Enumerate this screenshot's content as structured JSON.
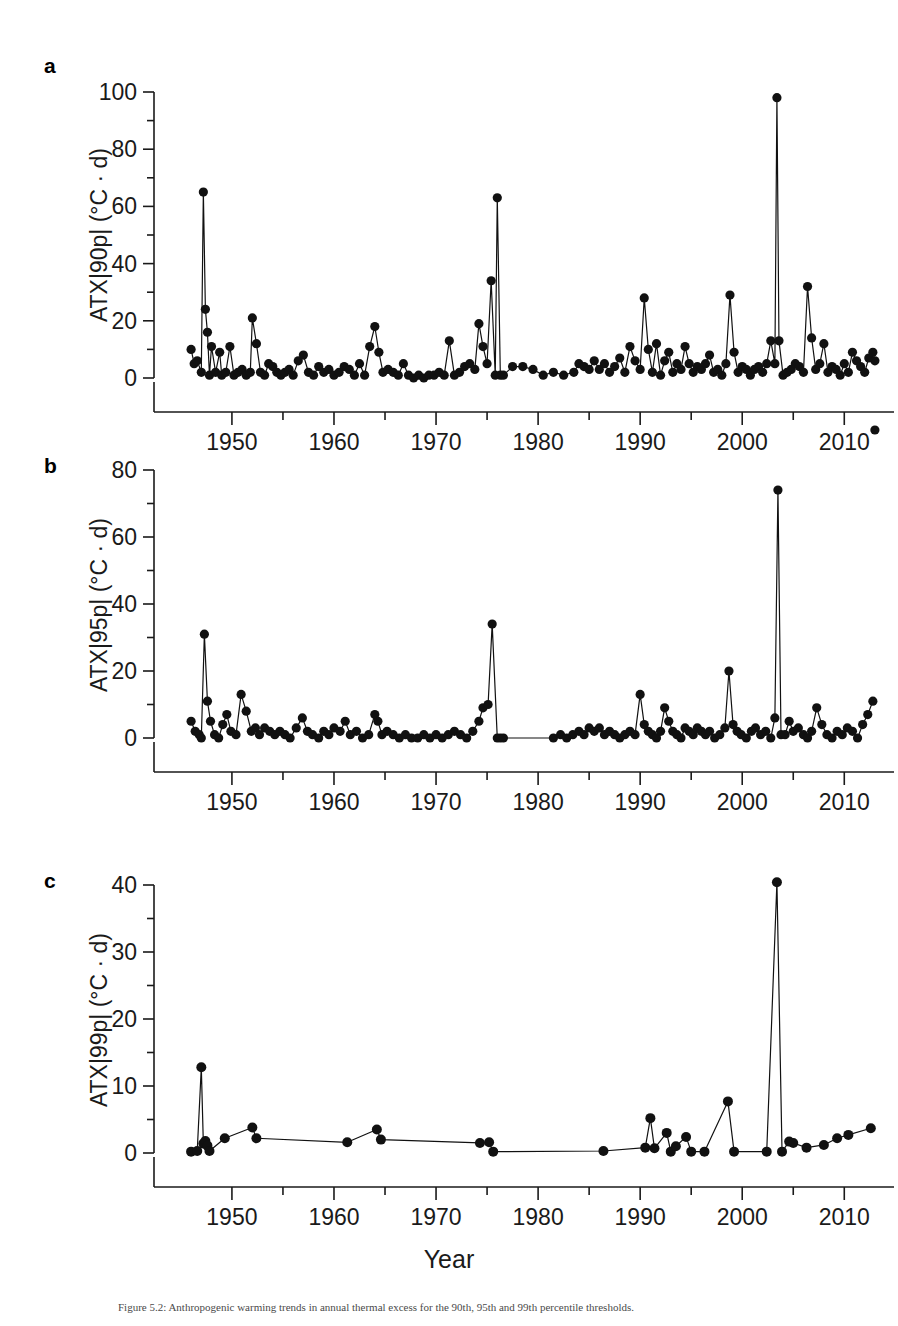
{
  "figure": {
    "panels": [
      {
        "letter": "a",
        "ylabel": "ATX|90p| (°C · d)",
        "xlabel": "",
        "id": "panel-a"
      },
      {
        "letter": "b",
        "ylabel": "ATX|95p| (°C · d)",
        "xlabel": "",
        "id": "panel-b"
      },
      {
        "letter": "c",
        "ylabel": "ATX|99p| (°C · d)",
        "xlabel": "Year",
        "id": "panel-c"
      }
    ],
    "caption": "Figure 5.2: Anthropogenic warming trends in annual thermal excess for the 90th, 95th and 99th percentile thresholds."
  },
  "chart_data": [
    {
      "type": "line",
      "panel": "a",
      "title": "",
      "xlabel": "",
      "ylabel": "ATX|90p| (°C · d)",
      "xlim": [
        1945.5,
        2013.5
      ],
      "ylim": [
        0,
        100
      ],
      "yticks": [
        0,
        20,
        40,
        60,
        80,
        100
      ],
      "ytick_minor_step": 10,
      "xticks": [
        1950,
        1960,
        1970,
        1980,
        1990,
        2000,
        2010
      ],
      "xtick_minor_step": 5,
      "grid": false,
      "legend": "none",
      "marker": "filled-circle",
      "x": [
        1946,
        1946.3,
        1946.6,
        1947,
        1947.2,
        1947.4,
        1947.6,
        1947.8,
        1948,
        1948.4,
        1948.8,
        1949,
        1949.4,
        1949.8,
        1950.2,
        1950.6,
        1951,
        1951.4,
        1951.8,
        1952,
        1952.4,
        1952.8,
        1953.2,
        1953.6,
        1954,
        1954.4,
        1954.8,
        1955.2,
        1955.6,
        1956,
        1956.5,
        1957,
        1957.5,
        1958,
        1958.5,
        1959,
        1959.5,
        1960,
        1960.5,
        1961,
        1961.5,
        1962,
        1962.5,
        1963,
        1963.5,
        1964,
        1964.4,
        1964.8,
        1965.3,
        1965.8,
        1966.3,
        1966.8,
        1967.3,
        1967.8,
        1968.3,
        1968.8,
        1969.3,
        1969.8,
        1970.3,
        1970.8,
        1971.3,
        1971.8,
        1972.3,
        1972.8,
        1973.3,
        1973.8,
        1974.2,
        1974.6,
        1975,
        1975.4,
        1975.8,
        1976,
        1976.3,
        1976.6,
        1977.5,
        1978.5,
        1979.5,
        1980.5,
        1981.5,
        1982.5,
        1983.5,
        1984,
        1984.5,
        1985,
        1985.5,
        1986,
        1986.5,
        1987,
        1987.5,
        1988,
        1988.5,
        1989,
        1989.5,
        1990,
        1990.4,
        1990.8,
        1991.2,
        1991.6,
        1992,
        1992.4,
        1992.8,
        1993.2,
        1993.6,
        1994,
        1994.4,
        1994.8,
        1995.2,
        1995.6,
        1996,
        1996.4,
        1996.8,
        1997.2,
        1997.6,
        1998,
        1998.4,
        1998.8,
        1999.2,
        1999.6,
        2000,
        2000.4,
        2000.8,
        2001.2,
        2001.6,
        2002,
        2002.4,
        2002.8,
        2003.2,
        2003.4,
        2003.6,
        2004,
        2004.4,
        2004.8,
        2005.2,
        2005.6,
        2006,
        2006.4,
        2006.8,
        2007.2,
        2007.6,
        2008,
        2008.4,
        2008.8,
        2009.2,
        2009.6,
        2010,
        2010.4,
        2010.8,
        2011.2,
        2011.6,
        2012,
        2012.4,
        2012.8,
        2013
      ],
      "y": [
        10,
        5,
        6,
        2,
        65,
        24,
        16,
        1,
        11,
        2,
        9,
        1,
        2,
        11,
        1,
        2,
        3,
        1,
        2,
        21,
        12,
        2,
        1,
        5,
        4,
        2,
        1,
        2,
        3,
        1,
        6,
        8,
        2,
        1,
        4,
        2,
        3,
        1,
        2,
        4,
        3,
        1,
        5,
        1,
        11,
        18,
        9,
        2,
        3,
        2,
        1,
        5,
        1,
        0,
        1,
        0,
        1,
        1,
        2,
        1,
        13,
        1,
        2,
        4,
        5,
        3,
        19,
        11,
        5,
        34,
        1,
        63,
        1,
        1,
        4,
        4,
        3,
        1,
        2,
        1,
        2,
        5,
        4,
        3,
        6,
        3,
        5,
        2,
        4,
        7,
        2,
        11,
        6,
        3,
        28,
        10,
        2,
        12,
        1,
        6,
        9,
        2,
        5,
        3,
        11,
        5,
        2,
        4,
        3,
        5,
        8,
        2,
        3,
        1,
        5,
        29,
        9,
        2,
        4,
        3,
        1,
        3,
        4,
        2,
        5,
        13,
        5,
        98,
        13,
        1,
        2,
        3,
        5,
        4,
        2,
        32,
        14,
        3,
        5,
        12,
        2,
        4,
        3,
        1,
        5,
        2,
        9,
        6,
        4,
        2,
        7,
        9,
        6,
        19
      ]
    },
    {
      "type": "line",
      "panel": "b",
      "title": "",
      "xlabel": "",
      "ylabel": "ATX|95p| (°C · d)",
      "xlim": [
        1945.5,
        2013.5
      ],
      "ylim": [
        0,
        80
      ],
      "yticks": [
        0,
        20,
        40,
        60,
        80
      ],
      "ytick_minor_step": 10,
      "xticks": [
        1950,
        1960,
        1970,
        1980,
        1990,
        2000,
        2010
      ],
      "xtick_minor_step": 5,
      "grid": false,
      "legend": "none",
      "marker": "filled-circle",
      "x": [
        1946,
        1946.4,
        1946.8,
        1947,
        1947.3,
        1947.6,
        1947.9,
        1948.3,
        1948.7,
        1949.1,
        1949.5,
        1949.9,
        1950.4,
        1950.9,
        1951.4,
        1951.9,
        1952.3,
        1952.7,
        1953.2,
        1953.7,
        1954.2,
        1954.7,
        1955.2,
        1955.7,
        1956.3,
        1956.9,
        1957.4,
        1957.9,
        1958.5,
        1959,
        1959.5,
        1960,
        1960.6,
        1961.1,
        1961.6,
        1962.2,
        1962.8,
        1963.4,
        1964,
        1964.3,
        1964.7,
        1965.2,
        1965.8,
        1966.4,
        1967,
        1967.6,
        1968.2,
        1968.8,
        1969.4,
        1970,
        1970.6,
        1971.2,
        1971.8,
        1972.4,
        1973,
        1973.6,
        1974.2,
        1974.6,
        1975.1,
        1975.5,
        1976,
        1976.3,
        1976.6,
        1981.5,
        1982.2,
        1982.8,
        1983.4,
        1984,
        1984.5,
        1985,
        1985.5,
        1986,
        1986.5,
        1987,
        1987.5,
        1988,
        1988.5,
        1989,
        1989.5,
        1990,
        1990.4,
        1990.8,
        1991.2,
        1991.6,
        1992,
        1992.4,
        1992.8,
        1993.2,
        1993.6,
        1994,
        1994.4,
        1994.8,
        1995.2,
        1995.6,
        1996,
        1996.4,
        1996.8,
        1997.3,
        1997.8,
        1998.3,
        1998.7,
        1999.1,
        1999.5,
        1999.9,
        2000.4,
        2000.9,
        2001.3,
        2001.8,
        2002.3,
        2002.8,
        2003.2,
        2003.5,
        2003.8,
        2004.2,
        2004.6,
        2005,
        2005.5,
        2006,
        2006.4,
        2006.8,
        2007.3,
        2007.8,
        2008.3,
        2008.8,
        2009.3,
        2009.8,
        2010.3,
        2010.8,
        2011.3,
        2011.8,
        2012.3,
        2012.8,
        2013
      ],
      "y": [
        5,
        2,
        1,
        0,
        31,
        11,
        5,
        1,
        0,
        4,
        7,
        2,
        1,
        13,
        8,
        2,
        3,
        1,
        3,
        2,
        1,
        2,
        1,
        0,
        3,
        6,
        2,
        1,
        0,
        2,
        1,
        3,
        2,
        5,
        1,
        2,
        0,
        1,
        7,
        5,
        1,
        2,
        1,
        0,
        1,
        0,
        0,
        1,
        0,
        1,
        0,
        1,
        2,
        1,
        0,
        2,
        5,
        9,
        10,
        34,
        0,
        0,
        0,
        0,
        1,
        0,
        1,
        2,
        1,
        3,
        2,
        3,
        1,
        2,
        1,
        0,
        1,
        2,
        1,
        13,
        4,
        2,
        1,
        0,
        2,
        9,
        5,
        2,
        1,
        0,
        3,
        2,
        1,
        3,
        2,
        1,
        2,
        0,
        1,
        3,
        20,
        4,
        2,
        1,
        0,
        2,
        3,
        1,
        2,
        0,
        6,
        74,
        1,
        1,
        5,
        2,
        3,
        1,
        0,
        2,
        9,
        4,
        1,
        0,
        2,
        1,
        3,
        2,
        0,
        4,
        7,
        11
      ]
    },
    {
      "type": "line",
      "panel": "c",
      "title": "",
      "xlabel": "Year",
      "ylabel": "ATX|99p| (°C · d)",
      "xlim": [
        1945.5,
        2013.5
      ],
      "ylim": [
        0,
        40
      ],
      "yticks": [
        0,
        10,
        20,
        30,
        40
      ],
      "ytick_minor_step": 5,
      "xticks": [
        1950,
        1960,
        1970,
        1980,
        1990,
        2000,
        2010
      ],
      "xtick_minor_step": 5,
      "grid": false,
      "legend": "none",
      "marker": "filled-circle",
      "x": [
        1946,
        1946.6,
        1947,
        1947.2,
        1947.4,
        1947.6,
        1947.8,
        1949.3,
        1952,
        1952.4,
        1961.3,
        1964.2,
        1964.6,
        1974.3,
        1975.2,
        1975.6,
        1986.4,
        1990.5,
        1991,
        1991.4,
        1992.6,
        1993,
        1993.5,
        1994.5,
        1995,
        1996.3,
        1998.6,
        1999.2,
        2002.4,
        2003.4,
        2003.9,
        2004.6,
        2005,
        2006.3,
        2008,
        2009.3,
        2010.4,
        2012.6
      ],
      "y": [
        0.2,
        0.3,
        12.8,
        1.4,
        1.8,
        1.1,
        0.3,
        2.2,
        3.8,
        2.2,
        1.6,
        3.5,
        2.0,
        1.5,
        1.6,
        0.2,
        0.3,
        0.8,
        5.2,
        0.7,
        3.0,
        0.2,
        1.0,
        2.4,
        0.2,
        0.2,
        7.7,
        0.2,
        0.2,
        40.4,
        0.2,
        1.7,
        1.5,
        0.8,
        1.2,
        2.2,
        2.7,
        3.7
      ]
    }
  ]
}
